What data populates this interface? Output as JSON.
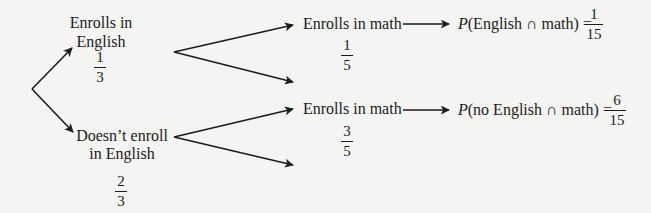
{
  "diagram": {
    "type": "probability-tree",
    "colors": {
      "background": "#f4f4f2",
      "ink": "#1c1c1c"
    },
    "level1": {
      "english": {
        "label_line1": "Enrolls in",
        "label_line2": "English",
        "prob_num": "1",
        "prob_den": "3"
      },
      "no_english": {
        "label_line1": "Doesn’t enroll",
        "label_line2": "in English",
        "prob_num": "2",
        "prob_den": "3"
      }
    },
    "level2": {
      "english_math": {
        "label": "Enrolls in math",
        "prob_num": "1",
        "prob_den": "5"
      },
      "no_english_math": {
        "label": "Enrolls in math",
        "prob_num": "3",
        "prob_den": "5"
      }
    },
    "results": {
      "english_math": {
        "p": "P",
        "expr": "(English ∩ math) =",
        "num": "1",
        "den": "15"
      },
      "no_english_math": {
        "p": "P",
        "expr": "(no English ∩ math) =",
        "num": "6",
        "den": "15"
      }
    }
  }
}
